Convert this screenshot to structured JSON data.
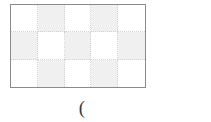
{
  "figure": {
    "name": "checkerboard-grid-figure",
    "grid": {
      "columns": 5,
      "rows": 3,
      "border_color": "#8a8a8a",
      "divider_color": "#d3d3d3",
      "shaded_color": "#f0f0f0",
      "empty_color": "#ffffff",
      "cells": [
        [
          {
            "shaded": false
          },
          {
            "shaded": true
          },
          {
            "shaded": false
          },
          {
            "shaded": true
          },
          {
            "shaded": false
          }
        ],
        [
          {
            "shaded": true
          },
          {
            "shaded": false
          },
          {
            "shaded": true
          },
          {
            "shaded": false
          },
          {
            "shaded": true
          }
        ],
        [
          {
            "shaded": false
          },
          {
            "shaded": true
          },
          {
            "shaded": false
          },
          {
            "shaded": true
          },
          {
            "shaded": false
          }
        ]
      ]
    },
    "caption": {
      "text": "(",
      "color": "#3a3a3a"
    }
  }
}
